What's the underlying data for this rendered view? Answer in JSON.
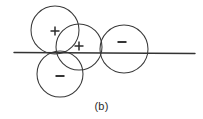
{
  "figure": {
    "caption": "(b)",
    "stroke_color": "#3a3a3a",
    "line_color": "#333333",
    "background": "#ffffff",
    "width": 203,
    "height": 119
  },
  "chart_data": {
    "type": "diagram",
    "title": "",
    "subtitle": "",
    "caption": "(b)",
    "xlabel": "",
    "ylabel": "",
    "grid": false,
    "legend": "none",
    "axis": {
      "name": "horizontal-axis-line",
      "x1": 14,
      "y1": 52,
      "x2": 195,
      "y2": 53,
      "label": ""
    },
    "circles": [
      {
        "name": "upper-left-circle",
        "cx": 55,
        "cy": 30,
        "r": 24,
        "sign": "+",
        "sign_x": 55,
        "sign_y": 31
      },
      {
        "name": "middle-circle",
        "cx": 79,
        "cy": 47,
        "r": 23,
        "sign": "+",
        "sign_x": 79,
        "sign_y": 46
      },
      {
        "name": "lower-left-circle",
        "cx": 60,
        "cy": 74,
        "r": 23,
        "sign": "−",
        "sign_x": 60,
        "sign_y": 76
      },
      {
        "name": "right-circle",
        "cx": 124,
        "cy": 49,
        "r": 24,
        "sign": "−",
        "sign_x": 122,
        "sign_y": 42
      }
    ],
    "signs": [
      "+",
      "+",
      "−",
      "−"
    ]
  }
}
